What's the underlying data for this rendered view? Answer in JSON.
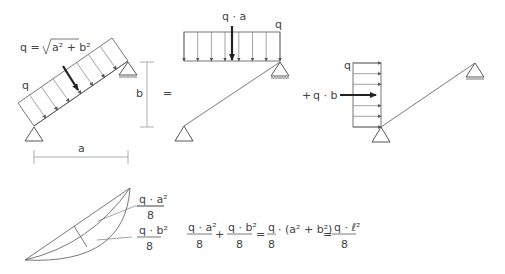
{
  "diagram": {
    "fig1": {
      "load_label": "q",
      "formula_lhs": "q =",
      "formula_sqrt_body": "a² + b²",
      "dim_a": "a",
      "dim_b": "b"
    },
    "operator_equals": "=",
    "fig2": {
      "resultant_label": "q · a",
      "load_label": "q"
    },
    "operator_plus": "+",
    "fig3": {
      "resultant_label": "q · b",
      "load_label": "q"
    },
    "moment_diagram": {
      "label_a_num": "q · a²",
      "label_a_den": "8",
      "label_b_num": "q · b²",
      "label_b_den": "8"
    },
    "equation": {
      "t1_num": "q · a²",
      "t1_den": "8",
      "plus": "+",
      "t2_num": "q · b²",
      "t2_den": "8",
      "eq1": "=",
      "t3_num": "q",
      "t3_den": "8",
      "t3_rest": "· (a² + b²)",
      "eq2": "=",
      "t4_num": "q · ℓ²",
      "t4_den": "8"
    }
  },
  "colors": {
    "line": "#555555",
    "text": "#444444",
    "dimension": "#999999",
    "resultant": "#222222"
  }
}
